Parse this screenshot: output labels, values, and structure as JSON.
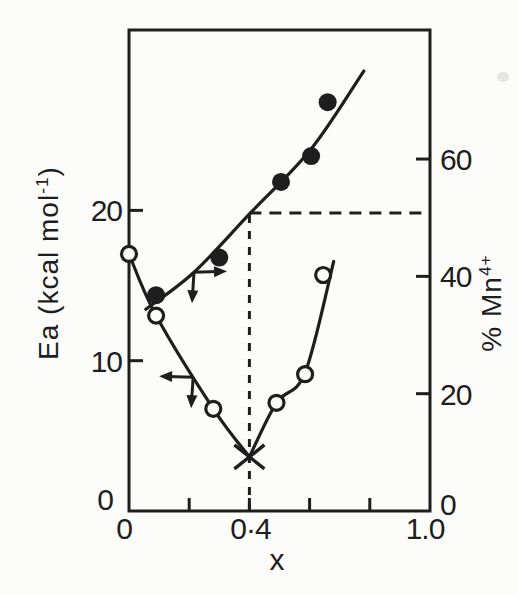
{
  "figure": {
    "paper_color": "#fcfcfa",
    "ink_color": "#1e1e1e"
  },
  "chart_data": {
    "type": "line",
    "title": "",
    "xlabel": "x",
    "grid": false,
    "legend_position": "none",
    "x_axis": {
      "range": [
        0,
        1.0
      ],
      "tick_marks": [
        0.2,
        0.4,
        0.6,
        0.8
      ],
      "labeled_ticks": [
        {
          "value": 0,
          "label": "0"
        },
        {
          "value": 0.4,
          "label": "0·4"
        },
        {
          "value": 1.0,
          "label": "1.0"
        }
      ]
    },
    "left_axis": {
      "label": "Ea (kcal mol⁻¹)",
      "label_parts": {
        "pre": "Ea (kcal mol",
        "sup": "-1",
        "post": ")"
      },
      "range": [
        0,
        32
      ],
      "ticks": [
        {
          "value": 0,
          "label": "0"
        },
        {
          "value": 10,
          "label": "10"
        },
        {
          "value": 20,
          "label": "20"
        }
      ]
    },
    "right_axis": {
      "label": "% Mn⁴⁺",
      "label_parts": {
        "pre": "% Mn",
        "sup": "4+",
        "post": ""
      },
      "range": [
        0,
        82
      ],
      "ticks": [
        {
          "value": 0,
          "label": "0"
        },
        {
          "value": 20,
          "label": "20"
        },
        {
          "value": 40,
          "label": "40"
        },
        {
          "value": 60,
          "label": "60"
        }
      ]
    },
    "series": [
      {
        "name": "activation-energy",
        "axis": "left",
        "marker": "open-circle",
        "points": [
          [
            0,
            17.1
          ],
          [
            0.09,
            13.0
          ],
          [
            0.28,
            6.8
          ],
          [
            0.49,
            7.2
          ],
          [
            0.585,
            9.1
          ],
          [
            0.645,
            15.7
          ]
        ],
        "curve_segments": [
          [
            [
              0,
              17.1
            ],
            [
              0.09,
              13.0
            ],
            [
              0.28,
              6.8
            ],
            [
              0.4,
              3.6
            ]
          ],
          [
            [
              0.4,
              3.6
            ],
            [
              0.49,
              7.2
            ],
            [
              0.585,
              9.2
            ],
            [
              0.68,
              16.6
            ]
          ]
        ],
        "minimum": {
          "marker": "x-cross",
          "point": [
            0.4,
            3.6
          ]
        }
      },
      {
        "name": "percent-mn4plus",
        "axis": "right",
        "marker": "filled-circle",
        "points": [
          [
            0.09,
            36.8
          ],
          [
            0.3,
            43.2
          ],
          [
            0.505,
            56.1
          ],
          [
            0.605,
            60.5
          ],
          [
            0.66,
            69.7
          ]
        ],
        "curve_segments": [
          [
            [
              0.056,
              34.4
            ],
            [
              0.216,
              40.7
            ],
            [
              0.405,
              50.9
            ],
            [
              0.605,
              61.7
            ],
            [
              0.78,
              75.0
            ]
          ]
        ]
      }
    ],
    "reference_lines": [
      {
        "orientation": "vertical",
        "x": 0.4,
        "style": "dashed",
        "to_right_axis_value": 50.8
      },
      {
        "orientation": "horizontal",
        "right_axis_value": 50.8,
        "x_start": 0.4,
        "x_end": 1.0,
        "style": "dashed"
      }
    ],
    "axis_pointers": [
      {
        "series": "percent-mn4plus",
        "axis": "right",
        "at": [
          0.216,
          40.7
        ],
        "arrows": [
          "right",
          "down"
        ]
      },
      {
        "series": "activation-energy",
        "axis": "left",
        "at": [
          0.213,
          8.9
        ],
        "arrows": [
          "left",
          "down"
        ]
      }
    ]
  }
}
